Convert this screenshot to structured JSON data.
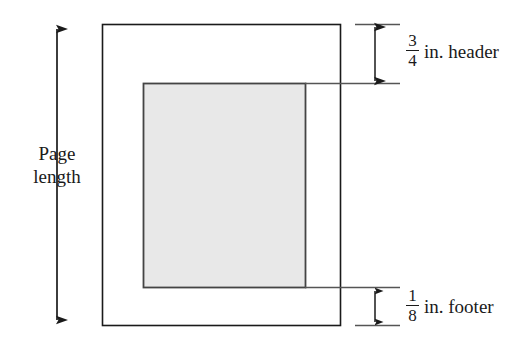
{
  "diagram": {
    "background_color": "#ffffff",
    "line_color": "#1a1a1a",
    "leader_color": "#555555",
    "shade_color": "#e8e8e8",
    "page_arrow": {
      "label_line1": "Page",
      "label_line2": "length",
      "direction": "double",
      "orientation": "vertical"
    },
    "header_measure": {
      "numerator": "3",
      "denominator": "4",
      "unit_label": "in. header"
    },
    "footer_measure": {
      "numerator": "1",
      "denominator": "8",
      "unit_label": "in. footer"
    },
    "page_rect": {
      "x": 102,
      "y": 24,
      "width": 238,
      "height": 301
    },
    "text_rect": {
      "x": 143,
      "y": 83,
      "width": 162,
      "height": 204
    }
  }
}
